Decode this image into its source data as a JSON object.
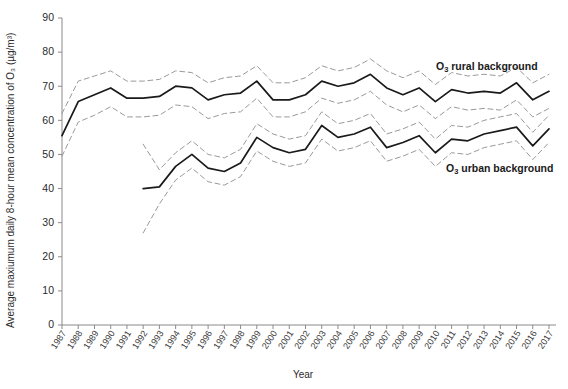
{
  "axes": {
    "ylabel": "Average maxiumum  daily 8-hour mean concentration of O₃ (µg/m³)",
    "xlabel": "Year",
    "yticks": [
      0,
      10,
      20,
      30,
      40,
      50,
      60,
      70,
      80,
      90
    ]
  },
  "annotations": {
    "rural": "O₃ rural background",
    "urban": "O₃ urban background",
    "rural_prefix": "O",
    "rural_sub": "3",
    "rural_rest": " rural background",
    "urban_prefix": "O",
    "urban_sub": "3",
    "urban_rest": " urban background"
  },
  "colors": {
    "series_main": "#1a1a1a",
    "series_ci": "#9a9a9a",
    "axis": "#8a8a8a",
    "background": "#ffffff"
  },
  "chart_data": {
    "type": "line",
    "title": "",
    "xlabel": "Year",
    "ylabel": "Average maxiumum  daily 8-hour mean concentration of O₃ (µg/m³)",
    "ylim": [
      0,
      90
    ],
    "ytick_step": 10,
    "grid": false,
    "legend_position": "in-plot annotations",
    "categories": [
      "1987",
      "1988",
      "1989",
      "1990",
      "1991",
      "1992",
      "1993",
      "1994",
      "1995",
      "1996",
      "1997",
      "1998",
      "1999",
      "2000",
      "2001",
      "2002",
      "2003",
      "2004",
      "2005",
      "2006",
      "2007",
      "2008",
      "2009",
      "2010",
      "2011",
      "2012",
      "2013",
      "2014",
      "2015",
      "2016",
      "2017"
    ],
    "series": [
      {
        "name": "O₃ rural background",
        "style": "solid",
        "values": [
          55.5,
          65.5,
          67.5,
          69.5,
          66.5,
          66.5,
          67.0,
          70.0,
          69.5,
          66.0,
          67.5,
          68.0,
          71.5,
          66.0,
          66.0,
          67.5,
          71.5,
          70.0,
          71.0,
          73.5,
          69.5,
          67.5,
          69.5,
          65.5,
          69.0,
          68.0,
          68.5,
          68.0,
          71.0,
          66.0,
          68.5
        ]
      },
      {
        "name": "O₃ rural background upper 95% CI",
        "style": "dashed",
        "values": [
          62.0,
          71.5,
          73.0,
          74.5,
          71.5,
          71.5,
          72.0,
          74.5,
          74.0,
          71.0,
          72.5,
          73.0,
          76.0,
          71.0,
          71.0,
          72.5,
          76.0,
          74.5,
          75.5,
          78.0,
          74.5,
          72.5,
          74.5,
          70.5,
          74.0,
          73.0,
          73.5,
          73.0,
          75.5,
          71.0,
          73.5
        ]
      },
      {
        "name": "O₃ rural background lower 95% CI",
        "style": "dashed",
        "values": [
          49.5,
          59.5,
          61.5,
          64.0,
          61.0,
          61.0,
          61.5,
          64.5,
          64.0,
          60.5,
          62.0,
          62.5,
          66.5,
          61.0,
          61.0,
          62.5,
          66.5,
          65.0,
          66.0,
          68.5,
          64.5,
          62.5,
          64.5,
          60.5,
          64.0,
          63.0,
          63.5,
          63.0,
          66.0,
          61.0,
          63.5
        ]
      },
      {
        "name": "O₃ urban background",
        "style": "solid",
        "start_index": 5,
        "values": [
          null,
          null,
          null,
          null,
          null,
          40.0,
          40.5,
          46.5,
          50.0,
          46.0,
          45.0,
          47.5,
          55.0,
          52.0,
          50.5,
          51.5,
          58.5,
          55.0,
          56.0,
          58.0,
          52.0,
          53.5,
          55.5,
          50.5,
          54.5,
          54.0,
          56.0,
          57.0,
          58.0,
          52.5,
          57.5
        ]
      },
      {
        "name": "O₃ urban background upper 95% CI",
        "style": "dashed",
        "start_index": 5,
        "values": [
          null,
          null,
          null,
          null,
          null,
          53.0,
          45.5,
          50.5,
          54.0,
          50.0,
          49.0,
          51.5,
          59.0,
          56.0,
          54.5,
          55.5,
          62.5,
          59.0,
          60.0,
          62.0,
          56.0,
          57.5,
          59.5,
          54.5,
          58.5,
          58.0,
          60.0,
          61.0,
          62.0,
          56.5,
          61.5
        ]
      },
      {
        "name": "O₃ urban background lower 95% CI",
        "style": "dashed",
        "start_index": 5,
        "values": [
          null,
          null,
          null,
          null,
          null,
          27.0,
          35.5,
          42.5,
          46.0,
          42.0,
          41.0,
          43.5,
          51.0,
          48.0,
          46.5,
          47.5,
          54.5,
          51.0,
          52.0,
          54.0,
          48.0,
          49.5,
          51.5,
          46.5,
          50.5,
          50.0,
          52.0,
          53.0,
          54.0,
          48.5,
          53.5
        ]
      }
    ]
  }
}
